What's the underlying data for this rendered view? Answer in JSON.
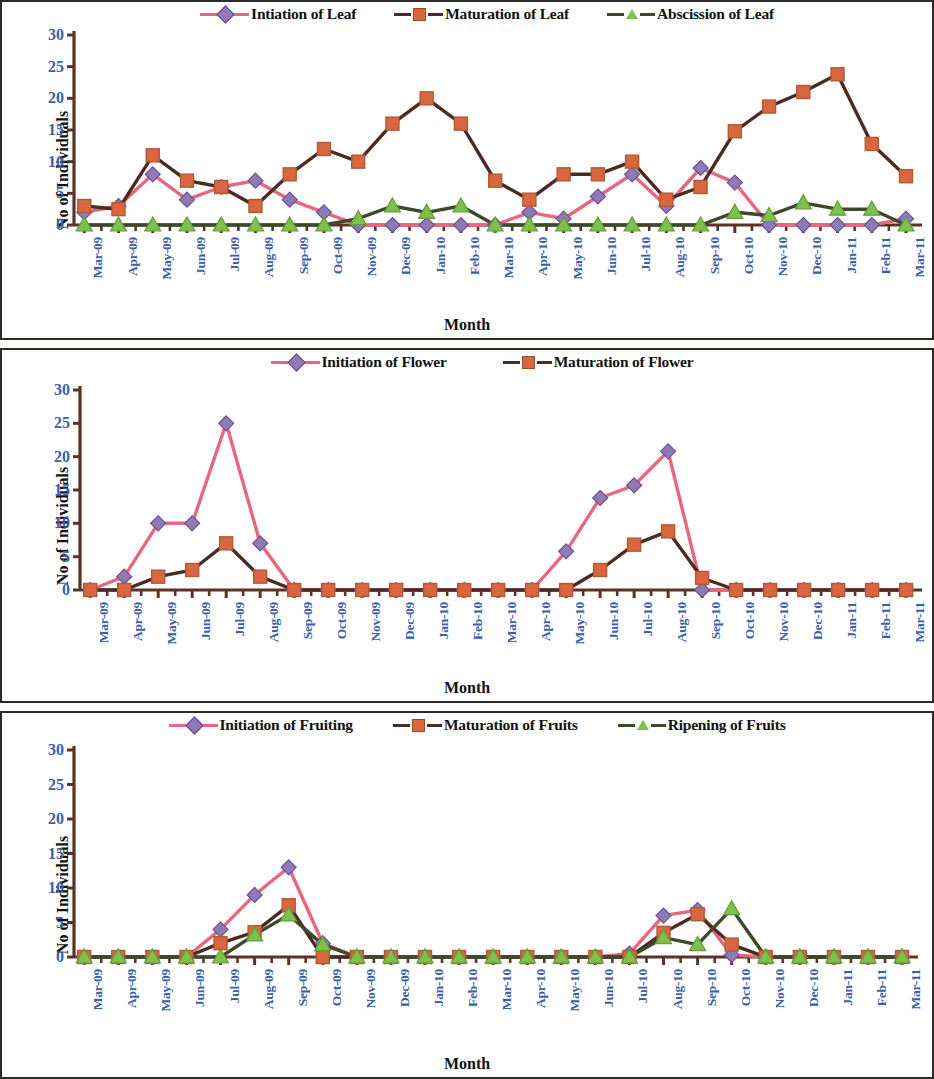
{
  "figure": {
    "axis_label_color": "#3b5ea8",
    "title_color": "#111111"
  },
  "colors": {
    "initiation_line": "#e8677d",
    "initiation_marker": "#8e7bb5",
    "maturation_line": "#4a2b22",
    "maturation_marker": "#d9663f",
    "abscission_line": "#3c4a2a",
    "abscission_marker": "#7fc04a",
    "axis": "#5a3326",
    "tick_text": "#3b5ea8",
    "panel_border": "#2b2b2b"
  },
  "charts": [
    {
      "id": "leaf-phenology-chart",
      "chart_data": {
        "type": "line",
        "title": "",
        "xlabel": "Month",
        "ylabel": "No of Individuals",
        "ylim": [
          0,
          30
        ],
        "yticks": [
          0,
          5,
          10,
          15,
          20,
          25,
          30
        ],
        "grid": false,
        "legend_position": "top",
        "categories": [
          "Mar-09",
          "Apr-09",
          "May-09",
          "Jun-09",
          "Jul-09",
          "Aug-09",
          "Sep-09",
          "Oct-09",
          "Nov-09",
          "Dec-09",
          "Jan-10",
          "Feb-10",
          "Mar-10",
          "Apr-10",
          "May-10",
          "Jun-10",
          "Jul-10",
          "Aug-10",
          "Sep-10",
          "Oct-10",
          "Nov-10",
          "Dec-10",
          "Jan-11",
          "Feb-11",
          "Mar-11"
        ],
        "series": [
          {
            "name": "Intiation of Leaf",
            "marker": "diamond",
            "line_color": "#e8677d",
            "marker_color": "#8e7bb5",
            "values": [
              2,
              3,
              8,
              4,
              6,
              7,
              4,
              2,
              0,
              0,
              0,
              0,
              0,
              2,
              1,
              4.5,
              8,
              3,
              9,
              6.7,
              0,
              0,
              0,
              0,
              1
            ]
          },
          {
            "name": "Maturation of Leaf",
            "marker": "square",
            "line_color": "#4a2b22",
            "marker_color": "#d9663f",
            "values": [
              3,
              2.5,
              11,
              7,
              6,
              3,
              8,
              12,
              10,
              16,
              20,
              16,
              7,
              4,
              8,
              8,
              10,
              4,
              6,
              14.8,
              18.7,
              21,
              23.8,
              12.8,
              7.7
            ]
          },
          {
            "name": "Abscission of Leaf",
            "marker": "triangle",
            "line_color": "#3c4a2a",
            "marker_color": "#7fc04a",
            "values": [
              0,
              0,
              0,
              0,
              0,
              0,
              0,
              0,
              1,
              3,
              2,
              3,
              0,
              0,
              0,
              0,
              0,
              0,
              0,
              2,
              1.5,
              3.5,
              2.5,
              2.5,
              0
            ]
          }
        ]
      }
    },
    {
      "id": "flower-phenology-chart",
      "chart_data": {
        "type": "line",
        "title": "",
        "xlabel": "Month",
        "ylabel": "No of Individuals",
        "ylim": [
          0,
          30
        ],
        "yticks": [
          0,
          5,
          10,
          15,
          20,
          25,
          30
        ],
        "grid": false,
        "legend_position": "top",
        "categories": [
          "Mar-09",
          "Apr-09",
          "May-09",
          "Jun-09",
          "Jul-09",
          "Aug-09",
          "Sep-09",
          "Oct-09",
          "Nov-09",
          "Dec-09",
          "Jan-10",
          "Feb-10",
          "Mar-10",
          "Apr-10",
          "May-10",
          "Jun-10",
          "Jul-10",
          "Aug-10",
          "Sep-10",
          "Oct-10",
          "Nov-10",
          "Dec-10",
          "Jan-11",
          "Feb-11",
          "Mar-11"
        ],
        "series": [
          {
            "name": "Initiation of Flower",
            "marker": "diamond",
            "line_color": "#e8677d",
            "marker_color": "#8e7bb5",
            "values": [
              0,
              2,
              10,
              10,
              25,
              7,
              0,
              0,
              0,
              0,
              0,
              0,
              0,
              0,
              5.8,
              13.8,
              15.7,
              20.8,
              0,
              0,
              0,
              0,
              0,
              0,
              0
            ]
          },
          {
            "name": "Maturation of  Flower",
            "marker": "square",
            "line_color": "#4a2b22",
            "marker_color": "#d9663f",
            "values": [
              0,
              0,
              2,
              3,
              7,
              2,
              0,
              0,
              0,
              0,
              0,
              0,
              0,
              0,
              0,
              3,
              6.8,
              8.8,
              1.8,
              0,
              0,
              0,
              0,
              0,
              0
            ]
          }
        ]
      }
    },
    {
      "id": "fruit-phenology-chart",
      "chart_data": {
        "type": "line",
        "title": "",
        "xlabel": "Month",
        "ylabel": "No of Individuals",
        "ylim": [
          0,
          30
        ],
        "yticks": [
          0,
          5,
          10,
          15,
          20,
          25,
          30
        ],
        "grid": false,
        "legend_position": "top",
        "categories": [
          "Mar-09",
          "Apr-09",
          "May-09",
          "Jun-09",
          "Jul-09",
          "Aug-09",
          "Sep-09",
          "Oct-09",
          "Nov-09",
          "Dec-09",
          "Jan-10",
          "Feb-10",
          "Mar-10",
          "Apr-10",
          "May-10",
          "Jun-10",
          "Jul-10",
          "Aug-10",
          "Sep-10",
          "Oct-10",
          "Nov-10",
          "Dec-10",
          "Jan-11",
          "Feb-11",
          "Mar-11"
        ],
        "series": [
          {
            "name": "Initiation of Fruiting",
            "marker": "diamond",
            "line_color": "#e8677d",
            "marker_color": "#8e7bb5",
            "values": [
              0,
              0,
              0,
              0,
              4,
              9,
              13,
              2,
              0,
              0,
              0,
              0,
              0,
              0,
              0,
              0,
              0.5,
              6,
              6.8,
              0.3,
              0,
              0,
              0,
              0,
              0
            ]
          },
          {
            "name": "Maturation of Fruits",
            "marker": "square",
            "line_color": "#4a2b22",
            "marker_color": "#d9663f",
            "values": [
              0,
              0,
              0,
              0,
              2,
              3.6,
              7.5,
              0,
              0,
              0,
              0,
              0,
              0,
              0,
              0,
              0,
              0,
              3.5,
              6.2,
              1.8,
              0,
              0,
              0,
              0,
              0
            ]
          },
          {
            "name": "Ripening of Fruits",
            "marker": "triangle",
            "line_color": "#3c4a2a",
            "marker_color": "#7fc04a",
            "values": [
              0,
              0,
              0,
              0,
              0,
              3.2,
              6.1,
              1.8,
              0,
              0,
              0,
              0,
              0,
              0,
              0,
              0,
              0,
              2.8,
              1.8,
              7,
              0,
              0,
              0,
              0,
              0
            ]
          }
        ]
      }
    }
  ]
}
